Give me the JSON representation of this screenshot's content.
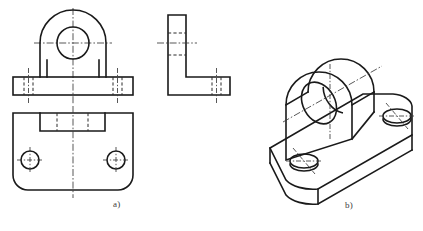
{
  "figure": {
    "background_color": "#ffffff",
    "line_color": "#1a1a1a",
    "centerline_color": "#3a3a3a",
    "width": 423,
    "height": 231
  },
  "captions": {
    "a": "a)",
    "b": "b)"
  },
  "views": {
    "front": {
      "name": "front-view",
      "label": "Front view (a)",
      "boss_outer_radius": 33,
      "boss_center_x": 73,
      "boss_center_y": 43,
      "bore_radius": 16,
      "base_left": 13,
      "base_right": 133,
      "base_top": 77,
      "base_bottom": 95,
      "web_left": 47,
      "web_right": 99,
      "hidden_holes": [
        {
          "cx": 28,
          "top": 77,
          "bottom": 95,
          "half_width": 6
        },
        {
          "cx": 118,
          "top": 77,
          "bottom": 95,
          "half_width": 6
        }
      ]
    },
    "side": {
      "name": "side-view",
      "label": "Side view (a)",
      "vertical_left": 168,
      "vertical_right": 186,
      "vertical_top": 15,
      "base_top": 77,
      "base_bottom": 95,
      "base_right": 230,
      "hidden_hole": {
        "cx": 217,
        "top": 77,
        "bottom": 95,
        "half_width": 6
      },
      "hidden_bore": {
        "cx": 177,
        "y1": 33,
        "y2": 55
      }
    },
    "top": {
      "name": "top-view",
      "label": "Top view (a)",
      "left": 13,
      "right": 133,
      "top": 113,
      "bottom": 190,
      "corner_radius": 15,
      "slot_left": 40,
      "slot_right": 105,
      "slot_bottom": 131,
      "holes": [
        {
          "cx": 30,
          "cy": 160,
          "r": 9
        },
        {
          "cx": 116,
          "cy": 160,
          "r": 9
        }
      ]
    },
    "isometric": {
      "name": "isometric-view",
      "label": "Isometric pictorial (b)",
      "boss_center_x": 330,
      "boss_center_y": 95,
      "bore_label": "through bore",
      "base_holes": 2
    }
  },
  "linetypes": {
    "visible": "continuous-thick",
    "hidden": "dashed",
    "center": "dash-dot"
  }
}
